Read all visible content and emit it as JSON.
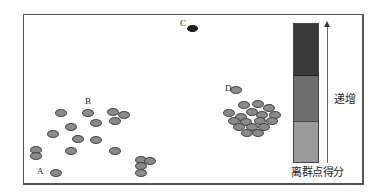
{
  "diagram": {
    "type": "outlier-detection-illustration",
    "labels": {
      "A": "A",
      "B": "B",
      "C": "C",
      "D": "D"
    },
    "legend": {
      "increase_label": "递增",
      "score_label": "离群点得分",
      "segments": [
        {
          "name": "high",
          "color": "#3a3a3a"
        },
        {
          "name": "medium",
          "color": "#6e6e6e"
        },
        {
          "name": "low",
          "color": "#9a9a9a"
        }
      ]
    },
    "points": {
      "sparse_cluster": [
        [
          61,
          113
        ],
        [
          88,
          113
        ],
        [
          113,
          112
        ],
        [
          124,
          115
        ],
        [
          96,
          123
        ],
        [
          115,
          121
        ],
        [
          71,
          127
        ],
        [
          53,
          134
        ],
        [
          78,
          139
        ],
        [
          96,
          140
        ],
        [
          36,
          150
        ],
        [
          36,
          156
        ],
        [
          71,
          151
        ],
        [
          115,
          151
        ],
        [
          56,
          173
        ],
        [
          141,
          160
        ],
        [
          150,
          161
        ],
        [
          141,
          166
        ],
        [
          141,
          173
        ]
      ],
      "dense_cluster": [
        [
          236,
          90
        ],
        [
          244,
          105
        ],
        [
          258,
          104
        ],
        [
          269,
          108
        ],
        [
          229,
          113
        ],
        [
          241,
          117
        ],
        [
          252,
          112
        ],
        [
          262,
          115
        ],
        [
          275,
          115
        ],
        [
          234,
          121
        ],
        [
          246,
          122
        ],
        [
          260,
          121
        ],
        [
          272,
          121
        ],
        [
          239,
          127
        ],
        [
          252,
          127
        ],
        [
          264,
          127
        ],
        [
          247,
          133
        ],
        [
          258,
          133
        ]
      ],
      "outlier_C": [
        193,
        29
      ],
      "outlier_A_label_pos": [
        37,
        168
      ]
    }
  }
}
